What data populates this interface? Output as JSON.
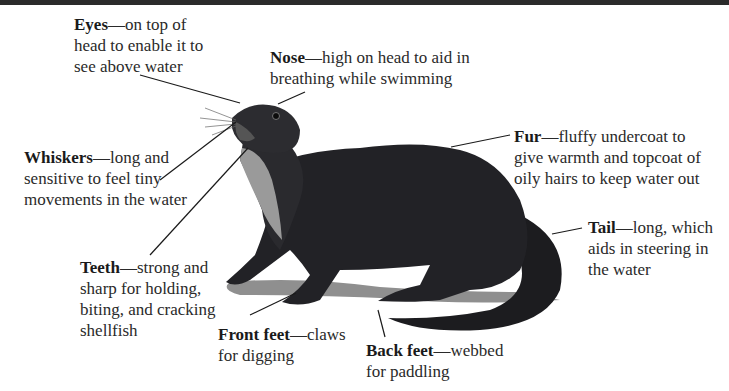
{
  "diagram": {
    "labels": [
      {
        "id": "eyes",
        "term": "Eyes",
        "desc": "—on top of head to enable it to see above water",
        "lines": [
          "—on top of",
          "head to enable it to",
          "see above water"
        ]
      },
      {
        "id": "nose",
        "term": "Nose",
        "desc": "—high on head to aid in breathing while swimming",
        "lines": [
          "—high on head to aid in",
          "breathing while swimming"
        ]
      },
      {
        "id": "whiskers",
        "term": "Whiskers",
        "desc": "—long and sensitive to feel tiny movements in the water",
        "lines": [
          "—long and",
          "sensitive to feel tiny",
          "movements in the water"
        ]
      },
      {
        "id": "fur",
        "term": "Fur",
        "desc": "—fluffy undercoat to give warmth and topcoat of oily hairs to keep water out",
        "lines": [
          "—fluffy undercoat to",
          "give warmth and topcoat of",
          "oily hairs to keep water out"
        ]
      },
      {
        "id": "tail",
        "term": "Tail",
        "desc": "—long, which aids in steering in the water",
        "lines": [
          "—long, which",
          "aids in steering in",
          "the water"
        ]
      },
      {
        "id": "teeth",
        "term": "Teeth",
        "desc": "—strong and sharp for holding, biting, and cracking shellfish",
        "lines": [
          "—strong and",
          "sharp for holding,",
          "biting, and cracking",
          "shellfish"
        ]
      },
      {
        "id": "front_feet",
        "term": "Front feet",
        "desc": "—claws for digging",
        "lines": [
          "—claws",
          "for digging"
        ]
      },
      {
        "id": "back_feet",
        "term": "Back feet",
        "desc": "—webbed for paddling",
        "lines": [
          "—webbed",
          "for paddling"
        ]
      }
    ]
  },
  "colors": {
    "fur": "#1f1f22",
    "throat": "#9a9a9a",
    "shadow": "#8c8c8c",
    "text": "#2a2a2a",
    "leader": "#1a1a1a"
  }
}
